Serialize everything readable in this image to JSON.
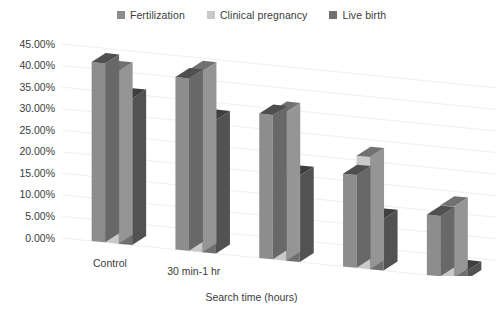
{
  "legend": {
    "items": [
      {
        "label": "Fertilization",
        "color": "#8d8d8d",
        "icon": "legend-square-icon"
      },
      {
        "label": "Clinical pregnancy",
        "color": "#c9c9c9",
        "icon": "legend-square-icon"
      },
      {
        "label": "Live birth",
        "color": "#6f6f6f",
        "icon": "legend-square-icon"
      }
    ]
  },
  "axis": {
    "x_title": "Search time (hours)",
    "y_ticks": [
      "45.00%",
      "40.00%",
      "35.00%",
      "30.00%",
      "25.00%",
      "20.00%",
      "15.00%",
      "10.00%",
      "5.00%",
      "0.00%"
    ],
    "x_labels": [
      "Control",
      "30 min-1 hr",
      "1–2 hr",
      "2–3 hr",
      ">3 hr"
    ]
  },
  "chart_data": {
    "type": "bar",
    "title": "",
    "subtitle": "",
    "xlabel": "Search time (hours)",
    "ylabel": "",
    "ylim": [
      0,
      45
    ],
    "ytick_step": 5,
    "ytick_format": "percent",
    "grid": true,
    "grid_axis": "y",
    "legend_position": "top-center",
    "style_3d": true,
    "categories": [
      "Control",
      "30 min-1 hr",
      "1–2 hr",
      "2–3 hr",
      ">3 hr"
    ],
    "series": [
      {
        "name": "Fertilization",
        "color": "#8d8d8d",
        "values": [
          41.5,
          40.0,
          33.5,
          21.5,
          14.0
        ]
      },
      {
        "name": "Clinical pregnancy",
        "color": "#c9c9c9",
        "values": [
          40.0,
          42.0,
          34.5,
          26.0,
          16.5
        ]
      },
      {
        "name": "Live birth",
        "color": "#6f6f6f",
        "values": [
          34.0,
          31.0,
          20.0,
          12.0,
          2.0
        ]
      }
    ],
    "value_labels_shown": false
  },
  "colors": {
    "background": "#ffffff",
    "gridline": "#efefef",
    "axis_text": "#3b3b3b",
    "bar_side_tint": "#555555",
    "bar_top_tint": "#3c3c3c"
  }
}
